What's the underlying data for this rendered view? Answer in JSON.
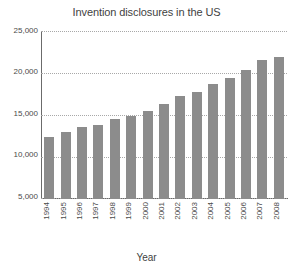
{
  "chart_data": {
    "type": "bar",
    "title": "Invention disclosures in the US",
    "xlabel": "Year",
    "ylabel": "",
    "categories": [
      "1994",
      "1995",
      "1996",
      "1997",
      "1998",
      "1999",
      "2000",
      "2001",
      "2002",
      "2003",
      "2004",
      "2005",
      "2006",
      "2007",
      "2008"
    ],
    "values": [
      9300,
      10000,
      10700,
      11000,
      11900,
      12300,
      13100,
      14200,
      15300,
      15900,
      17100,
      18000,
      19200,
      20700,
      21100
    ],
    "ylim": [
      0,
      25000
    ],
    "yticks": [
      5000,
      10000,
      15000,
      20000,
      25000
    ],
    "ytick_labels": [
      "5,000",
      "10,000",
      "15,000",
      "20,000",
      "25,000"
    ],
    "grid": true,
    "grid_axis": "y",
    "legend": false,
    "bar_color": "#8c8c8c",
    "background_color": "#ffffff",
    "axis_color": "#6b6b6b",
    "gridline_color": "#a8a8a8"
  }
}
